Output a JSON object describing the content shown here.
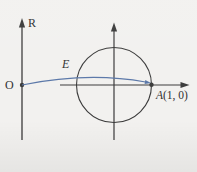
{
  "diagram": {
    "labels": {
      "real_line": "R",
      "origin": "O",
      "map": "E",
      "point_a_var": "A",
      "point_a_coords": "(1, 0)"
    },
    "colors": {
      "background": "#f2f1ef",
      "axis": "#3a3a3a",
      "curve": "#5a77a8",
      "text": "#2f2f2f"
    }
  }
}
